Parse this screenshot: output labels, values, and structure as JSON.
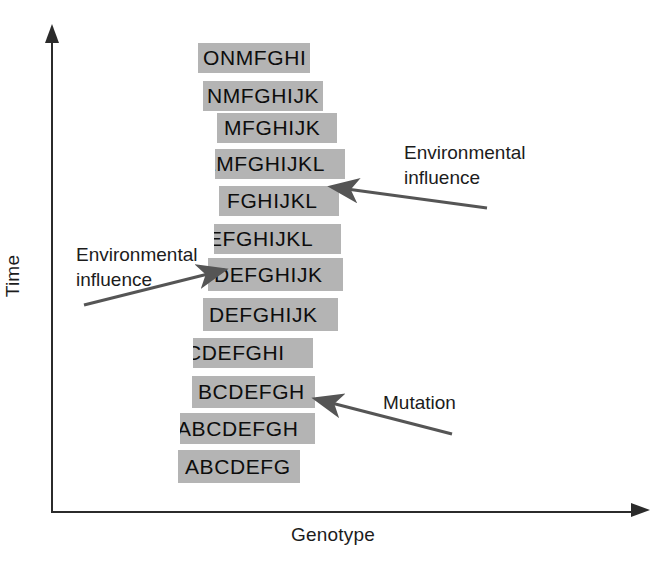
{
  "axes": {
    "y_label": "Time",
    "x_label": "Genotype"
  },
  "chart_data": {
    "type": "diagram",
    "title": "",
    "xlabel": "Genotype",
    "ylabel": "Time",
    "grid": false,
    "legend": "none",
    "rows": [
      {
        "index": 1,
        "sequence": "ONMFGHI",
        "bar_x": 198,
        "bar_y": 43,
        "bar_width": 112,
        "bar_height": 30,
        "text_offset": 5,
        "clipped_left": false,
        "clipped_right": false
      },
      {
        "index": 2,
        "sequence": "NMFGHIJK",
        "bar_x": 203,
        "bar_y": 81,
        "bar_width": 120,
        "bar_height": 30,
        "text_offset": 4,
        "clipped_left": false,
        "clipped_right": true
      },
      {
        "index": 3,
        "sequence": "MFGHIJK",
        "bar_x": 217,
        "bar_y": 113,
        "bar_width": 120,
        "bar_height": 30,
        "text_offset": 7,
        "clipped_left": false,
        "clipped_right": false
      },
      {
        "index": 4,
        "sequence": "LMFGHIJKL",
        "bar_x": 215,
        "bar_y": 149,
        "bar_width": 130,
        "bar_height": 30,
        "text_offset": -11,
        "clipped_left": true,
        "clipped_right": false
      },
      {
        "index": 5,
        "sequence": "FGHIJKL",
        "bar_x": 219,
        "bar_y": 186,
        "bar_width": 120,
        "bar_height": 30,
        "text_offset": 8,
        "clipped_left": false,
        "clipped_right": false
      },
      {
        "index": 6,
        "sequence": "EFGHIJKL",
        "bar_x": 214,
        "bar_y": 224,
        "bar_width": 127,
        "bar_height": 30,
        "text_offset": -6,
        "clipped_left": true,
        "clipped_right": false
      },
      {
        "index": 7,
        "sequence": "DEFGHIJK",
        "bar_x": 208,
        "bar_y": 258,
        "bar_width": 135,
        "bar_height": 33,
        "text_offset": 6,
        "clipped_left": false,
        "clipped_right": false
      },
      {
        "index": 8,
        "sequence": "DEFGHIJK",
        "bar_x": 203,
        "bar_y": 298,
        "bar_width": 135,
        "bar_height": 33,
        "text_offset": 6,
        "clipped_left": false,
        "clipped_right": false
      },
      {
        "index": 9,
        "sequence": "CDEFGHI",
        "bar_x": 193,
        "bar_y": 338,
        "bar_width": 120,
        "bar_height": 30,
        "text_offset": -7,
        "clipped_left": true,
        "clipped_right": true
      },
      {
        "index": 10,
        "sequence": "BCDEFGH",
        "bar_x": 192,
        "bar_y": 376,
        "bar_width": 123,
        "bar_height": 32,
        "text_offset": 6,
        "clipped_left": false,
        "clipped_right": false
      },
      {
        "index": 11,
        "sequence": "ABCDEFGH",
        "bar_x": 180,
        "bar_y": 413,
        "bar_width": 135,
        "bar_height": 31,
        "text_offset": -3,
        "clipped_left": true,
        "clipped_right": false
      },
      {
        "index": 12,
        "sequence": "ABCDEFG",
        "bar_x": 178,
        "bar_y": 450,
        "bar_width": 122,
        "bar_height": 33,
        "text_offset": 7,
        "clipped_left": false,
        "clipped_right": false
      }
    ],
    "annotations": [
      {
        "id": "environmental-influence-right",
        "label": "Environmental\ninfluence",
        "arrow_from": [
          487,
          208
        ],
        "arrow_to": [
          332,
          187
        ]
      },
      {
        "id": "environmental-influence-left",
        "label": "Environmental\ninfluence",
        "arrow_from": [
          84,
          305
        ],
        "arrow_to": [
          224,
          270
        ]
      },
      {
        "id": "mutation",
        "label": "Mutation",
        "arrow_from": [
          452,
          434
        ],
        "arrow_to": [
          316,
          399
        ]
      }
    ]
  },
  "annotations": {
    "env_right": {
      "label": "Environmental\ninfluence"
    },
    "env_left": {
      "label": "Environmental\ninfluence"
    },
    "mutation": {
      "label": "Mutation"
    }
  },
  "colors": {
    "bar_fill": "#b4b4b4",
    "text": "#0d0d0d",
    "axis": "#2b2b2b",
    "arrow": "#555555",
    "background": "#ffffff"
  }
}
